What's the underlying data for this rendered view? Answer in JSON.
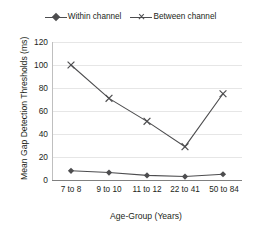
{
  "chart_data": {
    "type": "line",
    "title": "",
    "xlabel": "Age-Group (Years)",
    "ylabel": "Mean Gap Detection Thresholds (ms)",
    "categories": [
      "7 to 8",
      "9 to 10",
      "11 to 12",
      "22 to 41",
      "50 to 84"
    ],
    "series": [
      {
        "name": "Within channel",
        "marker": "diamond",
        "color": "#4d4d4f",
        "values": [
          8,
          6.5,
          4,
          3,
          5
        ]
      },
      {
        "name": "Between channel",
        "marker": "x",
        "color": "#4d4d4f",
        "values": [
          100,
          71,
          51,
          29,
          75
        ]
      }
    ],
    "ylim": [
      0,
      120
    ],
    "yticks": [
      0,
      20,
      40,
      60,
      80,
      100,
      120
    ],
    "ytick_labels": [
      "0",
      "20",
      "40",
      "60",
      "80",
      "100",
      "120"
    ],
    "grid": "horizontal",
    "legend_position": "top-center",
    "background_color": "#ffffff",
    "gridline_color": "#e6e6e6",
    "axis_color": "#808080"
  },
  "legend": {
    "entries": [
      {
        "label": "Within channel",
        "marker": "diamond-marker-icon"
      },
      {
        "label": "Between channel",
        "marker": "x-marker-icon"
      }
    ]
  }
}
